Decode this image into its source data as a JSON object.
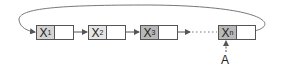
{
  "diagram": {
    "type": "circular-linked-list",
    "nodes": [
      {
        "id": "x1",
        "label": "X",
        "subscript": "1",
        "shade": "#d4d4d4"
      },
      {
        "id": "x2",
        "label": "X",
        "subscript": "2",
        "shade": "#e6e6e6"
      },
      {
        "id": "x3",
        "label": "X",
        "subscript": "3",
        "shade": "#b8b8b8"
      },
      {
        "id": "xn",
        "label": "X",
        "subscript": "n",
        "shade": "#b8b8b8"
      }
    ],
    "ellipsis": "......",
    "pointer_label": "A",
    "pointer_target": "xn",
    "colors": {
      "line": "#555555",
      "arrow": "#555555"
    }
  }
}
